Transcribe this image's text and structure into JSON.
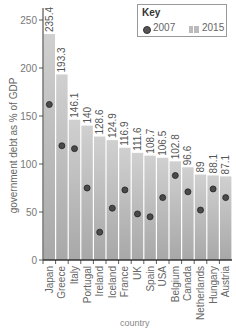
{
  "chart_data": {
    "type": "bar",
    "title": "",
    "xlabel": "country",
    "ylabel": "government debt as % of GDP",
    "ylim": [
      0,
      260
    ],
    "yticks": [
      0,
      50,
      100,
      150,
      200,
      250
    ],
    "grid": false,
    "legend": {
      "title": "Key",
      "position": "top-right",
      "entries": [
        {
          "label": "2007",
          "marker": "dot"
        },
        {
          "label": "2015",
          "marker": "bar"
        }
      ]
    },
    "categories": [
      "Japan",
      "Greece",
      "Italy",
      "Portugal",
      "Ireland",
      "Iceland",
      "France",
      "UK",
      "Spain",
      "USA",
      "Belgium",
      "Canada",
      "Netherlands",
      "Hungary",
      "Austria"
    ],
    "series": [
      {
        "name": "2015",
        "type": "bar",
        "values": [
          235.4,
          193.3,
          146.1,
          140,
          128.6,
          124.9,
          116.9,
          111.6,
          108.7,
          106.5,
          102.8,
          96.6,
          89,
          88.1,
          87.1
        ],
        "labels": [
          "235.4",
          "193.3",
          "146.1",
          "140",
          "128.6",
          "124.9",
          "116.9",
          "111.6",
          "108.7",
          "106.5",
          "102.8",
          "96.6",
          "89",
          "88.1",
          "87.1"
        ]
      },
      {
        "name": "2007",
        "type": "scatter",
        "values": [
          162,
          119,
          116,
          75,
          29,
          54,
          73,
          48,
          45,
          65,
          88,
          71,
          52,
          74,
          65
        ]
      }
    ]
  },
  "colors": {
    "bar": "#b5b5b5",
    "bar_light": "#d0d0d0",
    "dot": "#4a4a4a",
    "axis": "#333333",
    "text": "#666666"
  }
}
